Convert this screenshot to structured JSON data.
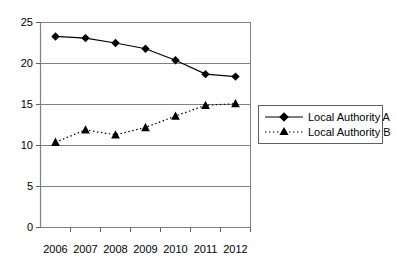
{
  "chart_data": {
    "type": "line",
    "title": "",
    "subtitle": "",
    "xlabel": "",
    "ylabel": "",
    "categories": [
      "2006",
      "2007",
      "2008",
      "2009",
      "2010",
      "2011",
      "2012"
    ],
    "ylim": [
      0,
      25
    ],
    "yticks": [
      0,
      5,
      10,
      15,
      20,
      25
    ],
    "ytick_labels": [
      "0",
      "5",
      "10",
      "15",
      "20",
      "25"
    ],
    "grid": true,
    "grid_axis": "y",
    "legend_position": "right",
    "series": [
      {
        "name": "Local Authority A",
        "marker": "diamond",
        "linestyle": "solid",
        "color": "#000000",
        "values": [
          23.3,
          23.1,
          22.5,
          21.8,
          20.4,
          18.7,
          18.4
        ]
      },
      {
        "name": "Local Authority B",
        "marker": "triangle",
        "linestyle": "dotted",
        "color": "#000000",
        "values": [
          10.4,
          11.9,
          11.3,
          12.2,
          13.6,
          14.9,
          15.1
        ]
      }
    ]
  },
  "axes": {
    "y_tick_0": "0",
    "y_tick_1": "5",
    "y_tick_2": "10",
    "y_tick_3": "15",
    "y_tick_4": "20",
    "y_tick_5": "25",
    "x_tick_0": "2006",
    "x_tick_1": "2007",
    "x_tick_2": "2008",
    "x_tick_3": "2009",
    "x_tick_4": "2010",
    "x_tick_5": "2011",
    "x_tick_6": "2012"
  },
  "legend": {
    "entry_a": "Local Authority A",
    "entry_b": "Local Authority B"
  },
  "colors": {
    "line": "#000000",
    "grid": "#808080",
    "axis": "#808080",
    "background": "#ffffff",
    "legend_border": "#606060"
  }
}
